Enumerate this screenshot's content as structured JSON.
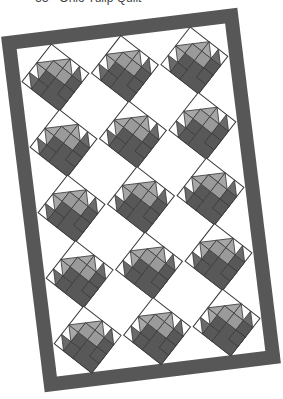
{
  "caption": {
    "text": "— 55 · Ohio Tulip Quilt",
    "visible_partial": true
  },
  "quilt": {
    "name": "tulip-basket-quilt",
    "rotation_deg": -7,
    "grid": {
      "columns": 3,
      "rows": 5
    },
    "block_setting": "on-point",
    "block_motif": "tulip-basket",
    "colors": {
      "border": "#575757",
      "background": "#ffffff",
      "block_outline": "#3a3a3a",
      "basket_dark": "#585858",
      "petal_side": "#6a6a6a",
      "petal_light": "#a6a6a6",
      "center_light": "#9a9a9a",
      "corner_fill": "#ffffff"
    }
  }
}
